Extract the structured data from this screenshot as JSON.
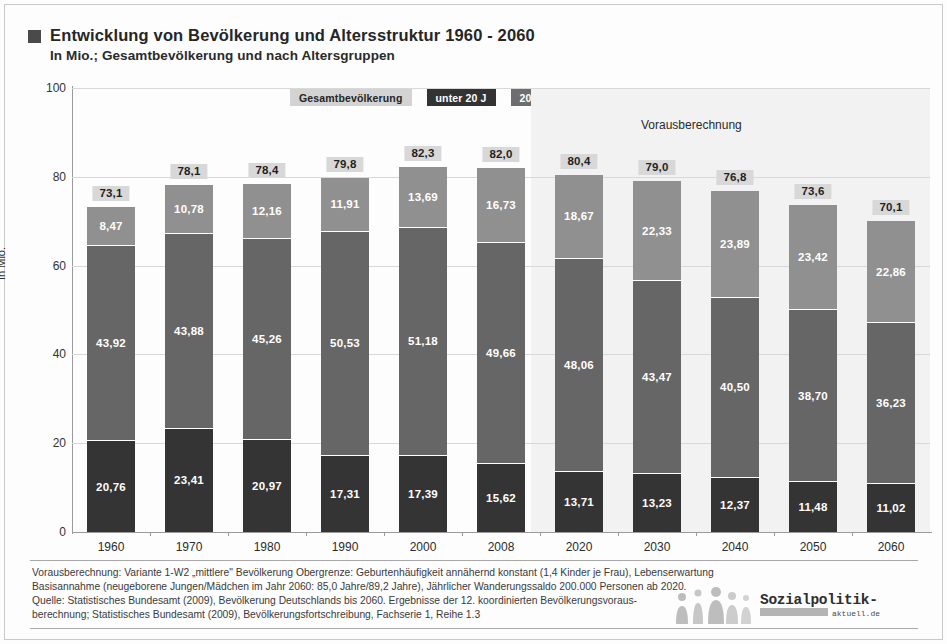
{
  "title": {
    "main": "Entwicklung von Bevölkerung und Altersstruktur 1960 - 2060",
    "sub": "In Mio.; Gesamtbevölkerung und nach Altersgruppen",
    "marker_icon": "square-bullet-icon"
  },
  "legend": {
    "items": [
      {
        "label": "Gesamtbevölkerung",
        "color": "#d3d3d3",
        "text_color": "#242424"
      },
      {
        "label": "unter 20 J",
        "color": "#333333",
        "text_color": "#ffffff"
      },
      {
        "label": "20 bis unter 65 Jahre",
        "color": "#6e6e6e",
        "text_color": "#ffffff"
      },
      {
        "label": "65 Jahre und älter",
        "color": "#9a9a9a",
        "text_color": "#ffffff"
      }
    ]
  },
  "annotation": {
    "forecast": "Vorausberechnung"
  },
  "chart_data": {
    "type": "bar",
    "title": "Entwicklung von Bevölkerung und Altersstruktur 1960 - 2060",
    "subtitle": "In Mio.; Gesamtbevölkerung und nach Altersgruppen",
    "xlabel": "",
    "ylabel": "In Mio.",
    "ylim": [
      0,
      100
    ],
    "yticks": [
      0,
      20,
      40,
      60,
      80,
      100
    ],
    "ytick_labels": [
      "0",
      "20",
      "40",
      "60",
      "80",
      "100"
    ],
    "grid": true,
    "legend_position": "top",
    "stacked": true,
    "categories": [
      "1960",
      "1970",
      "1980",
      "1990",
      "2000",
      "2008",
      "2020",
      "2030",
      "2040",
      "2050",
      "2060"
    ],
    "series": [
      {
        "name": "unter 20 J",
        "color": "#343434",
        "values": [
          20.76,
          23.41,
          20.97,
          17.31,
          17.39,
          15.62,
          13.71,
          13.23,
          12.37,
          11.48,
          11.02
        ],
        "labels": [
          "20,76",
          "23,41",
          "20,97",
          "17,31",
          "17,39",
          "15,62",
          "13,71",
          "13,23",
          "12,37",
          "11,48",
          "11,02"
        ]
      },
      {
        "name": "20 bis unter 65 Jahre",
        "color": "#666666",
        "values": [
          43.92,
          43.88,
          45.26,
          50.53,
          51.18,
          49.66,
          48.06,
          43.47,
          40.5,
          38.7,
          36.23
        ],
        "labels": [
          "43,92",
          "43,88",
          "45,26",
          "50,53",
          "51,18",
          "49,66",
          "48,06",
          "43,47",
          "40,50",
          "38,70",
          "36,23"
        ]
      },
      {
        "name": "65 Jahre und älter",
        "color": "#909090",
        "values": [
          8.47,
          10.78,
          12.16,
          11.91,
          13.69,
          16.73,
          18.67,
          22.33,
          23.89,
          23.42,
          22.86
        ],
        "labels": [
          "8,47",
          "10,78",
          "12,16",
          "11,91",
          "13,69",
          "16,73",
          "18,67",
          "22,33",
          "23,89",
          "23,42",
          "22,86"
        ]
      }
    ],
    "totals": {
      "name": "Gesamtbevölkerung",
      "values": [
        73.1,
        78.1,
        78.4,
        79.8,
        82.3,
        82.0,
        80.4,
        79.0,
        76.8,
        73.6,
        70.1
      ],
      "labels": [
        "73,1",
        "78,1",
        "78,4",
        "79,8",
        "82,3",
        "82,0",
        "80,4",
        "79,0",
        "76,8",
        "73,6",
        "70,1"
      ]
    },
    "forecast_from": "2020",
    "annotations": [
      "Vorausberechnung"
    ]
  },
  "footer": {
    "lines": [
      "Vorausberechnung: Variante 1-W2 „mittlere\" Bevölkerung Obergrenze: Geburtenhäufigkeit annähernd konstant (1,4 Kinder je Frau), Lebenserwartung",
      "Basisannahme (neugeborene Jungen/Mädchen im Jahr 2060: 85,0 Jahre/89,2 Jahre), Jährlicher Wanderungssaldo 200.000 Personen ab 2020.",
      "Quelle: Statistisches Bundesamt (2009), Bevölkerung Deutschlands bis 2060. Ergebnisse der 12. koordinierten Bevölkerungsvoraus-",
      "berechnung; Statistisches Bundesamt (2009), Bevölkerungsfortschreibung, Fachserie 1, Reihe 1.3"
    ]
  },
  "logo": {
    "name": "Sozialpolitik-",
    "domain": "aktuell.de"
  }
}
